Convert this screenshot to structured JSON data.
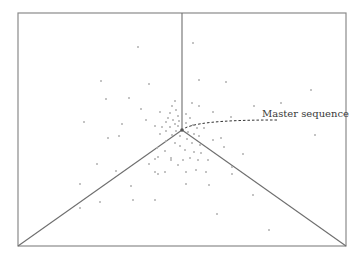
{
  "diagram": {
    "type": "quasispecies-mutant-distribution",
    "frame": {
      "x1": 18,
      "y1": 13,
      "x2": 346,
      "y2": 246,
      "color": "#8a8a8a"
    },
    "center": {
      "x": 182,
      "y": 130
    },
    "axes": [
      {
        "name": "axis-top",
        "x2": 182,
        "y2": 13
      },
      {
        "name": "axis-bottom-left",
        "x2": 18,
        "y2": 246
      },
      {
        "name": "axis-bottom-right",
        "x2": 346,
        "y2": 246
      }
    ],
    "line_color": "#6e6e6e",
    "point_color": "#b0b0b0",
    "annotation": {
      "label": "Master sequence",
      "label_x": 262,
      "label_y": 108,
      "arrow_path": "M277,120 C240,120 200,121 185,128",
      "color": "#333333"
    },
    "points": [
      [
        138,
        47
      ],
      [
        193,
        43
      ],
      [
        101,
        81
      ],
      [
        149,
        84
      ],
      [
        199,
        80
      ],
      [
        226,
        82
      ],
      [
        311,
        90
      ],
      [
        106,
        99
      ],
      [
        129,
        98
      ],
      [
        141,
        109
      ],
      [
        160,
        112
      ],
      [
        84,
        122
      ],
      [
        122,
        124
      ],
      [
        146,
        120
      ],
      [
        254,
        106
      ],
      [
        175,
        101
      ],
      [
        192,
        103
      ],
      [
        199,
        106
      ],
      [
        213,
        112
      ],
      [
        231,
        117
      ],
      [
        172,
        106
      ],
      [
        176,
        110
      ],
      [
        170,
        113
      ],
      [
        178,
        116
      ],
      [
        168,
        118
      ],
      [
        186,
        114
      ],
      [
        190,
        118
      ],
      [
        173,
        120
      ],
      [
        179,
        121
      ],
      [
        166,
        122
      ],
      [
        175,
        124
      ],
      [
        186,
        123
      ],
      [
        193,
        125
      ],
      [
        170,
        127
      ],
      [
        178,
        126
      ],
      [
        162,
        127
      ],
      [
        155,
        126
      ],
      [
        197,
        128
      ],
      [
        204,
        128
      ],
      [
        176,
        131
      ],
      [
        166,
        131
      ],
      [
        188,
        132
      ],
      [
        194,
        134
      ],
      [
        199,
        136
      ],
      [
        172,
        135
      ],
      [
        180,
        136
      ],
      [
        160,
        134
      ],
      [
        213,
        140
      ],
      [
        221,
        138
      ],
      [
        187,
        139
      ],
      [
        166,
        141
      ],
      [
        175,
        143
      ],
      [
        180,
        146
      ],
      [
        192,
        143
      ],
      [
        200,
        145
      ],
      [
        224,
        147
      ],
      [
        157,
        148
      ],
      [
        165,
        151
      ],
      [
        185,
        150
      ],
      [
        194,
        152
      ],
      [
        201,
        153
      ],
      [
        158,
        157
      ],
      [
        171,
        158
      ],
      [
        183,
        160
      ],
      [
        190,
        158
      ],
      [
        198,
        160
      ],
      [
        208,
        160
      ],
      [
        232,
        167
      ],
      [
        149,
        164
      ],
      [
        155,
        159
      ],
      [
        171,
        160
      ],
      [
        178,
        165
      ],
      [
        196,
        170
      ],
      [
        155,
        172
      ],
      [
        158,
        174
      ],
      [
        165,
        172
      ],
      [
        186,
        172
      ],
      [
        206,
        172
      ],
      [
        108,
        138
      ],
      [
        119,
        136
      ],
      [
        97,
        164
      ],
      [
        116,
        171
      ],
      [
        243,
        154
      ],
      [
        232,
        174
      ],
      [
        186,
        184
      ],
      [
        209,
        185
      ],
      [
        253,
        195
      ],
      [
        80,
        184
      ],
      [
        131,
        186
      ],
      [
        100,
        202
      ],
      [
        133,
        200
      ],
      [
        155,
        200
      ],
      [
        80,
        208
      ],
      [
        217,
        214
      ],
      [
        269,
        230
      ],
      [
        315,
        135
      ],
      [
        281,
        103
      ]
    ]
  }
}
